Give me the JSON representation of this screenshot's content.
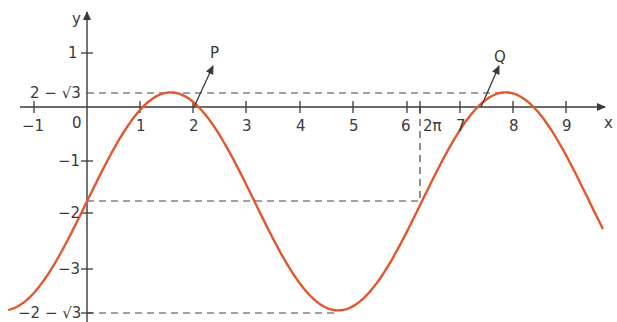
{
  "chart_data": {
    "type": "line",
    "title": "",
    "function": "y = 2 sin x - sqrt(3)",
    "xlabel": "x",
    "ylabel": "y",
    "xlim": [
      -1.5,
      9.7
    ],
    "ylim": [
      -3.75,
      1.7
    ],
    "x_ticks": [
      "-1",
      "1",
      "2",
      "3",
      "4",
      "5",
      "6",
      "2π",
      "7",
      "8",
      "9"
    ],
    "x_tick_values": [
      -1,
      1,
      2,
      3,
      4,
      5,
      6,
      6.283,
      7,
      8,
      9
    ],
    "y_ticks": [
      "1",
      "2 − √3",
      "0",
      "−1",
      "−2",
      "−3",
      "−2 − √3"
    ],
    "y_tick_values": [
      1,
      0.268,
      0,
      -1,
      -2,
      -3,
      -3.732
    ],
    "origin_label": "0",
    "grid": false,
    "series": [
      {
        "name": "curve",
        "color": "#e4572e"
      }
    ],
    "annotations": [
      {
        "label": "P",
        "x": 2.094,
        "y": 0
      },
      {
        "label": "Q",
        "x": 7.33,
        "y": 0
      }
    ],
    "guide_lines": [
      {
        "type": "horizontal",
        "y": 0.268,
        "dashed": true
      },
      {
        "type": "horizontal",
        "y": -1.732,
        "dashed": true
      },
      {
        "type": "vertical",
        "x": 6.283,
        "dashed": true
      },
      {
        "type": "horizontal",
        "y": -3.732,
        "dashed": true
      }
    ]
  },
  "labels": {
    "x_axis": "x",
    "y_axis": "y",
    "origin": "0",
    "P": "P",
    "Q": "Q",
    "xt_m1": "−1",
    "xt_1": "1",
    "xt_2": "2",
    "xt_3": "3",
    "xt_4": "4",
    "xt_5": "5",
    "xt_6": "6",
    "xt_2pi": "2π",
    "xt_7": "7",
    "xt_8": "8",
    "xt_9": "9",
    "yt_1": "1",
    "yt_2m3": "2 − √3",
    "yt_m1": "−1",
    "yt_m2": "−2",
    "yt_m3": "−3",
    "yt_m2m3": "−2 − √3"
  }
}
